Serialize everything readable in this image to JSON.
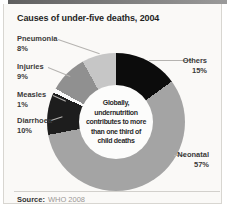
{
  "title": "Causes of under-five deaths, 2004",
  "source": {
    "label": "Source:",
    "value": "WHO 2008"
  },
  "chart_data": {
    "type": "pie",
    "subtype": "donut",
    "title": "Causes of under-five deaths, 2004",
    "units": "percent of global under-five deaths",
    "start_angle_deg": 0,
    "clockwise": true,
    "segments": [
      {
        "label": "Others",
        "value": 15,
        "pct": "15%",
        "color": "#0c0c0c"
      },
      {
        "label": "Neonatal",
        "value": 57,
        "pct": "57%",
        "color": "#a4a4a4"
      },
      {
        "label": "Diarrhoea",
        "value": 10,
        "pct": "10%",
        "color": "#1d1d1d"
      },
      {
        "label": "Measles",
        "value": 1,
        "pct": "1%",
        "color": "#f8f8f8"
      },
      {
        "label": "Injuries",
        "value": 9,
        "pct": "9%",
        "color": "#909090"
      },
      {
        "label": "Pneumonia",
        "value": 8,
        "pct": "8%",
        "color": "#c6c6c6"
      }
    ],
    "center_label": "Globally, undernutrition contributes to more than one third of child deaths",
    "center_lines": [
      "Globally,",
      "undernutrition",
      "contributes to more",
      "than one third of",
      "child deaths"
    ],
    "legend_position": "callout-labels",
    "grid": false
  }
}
